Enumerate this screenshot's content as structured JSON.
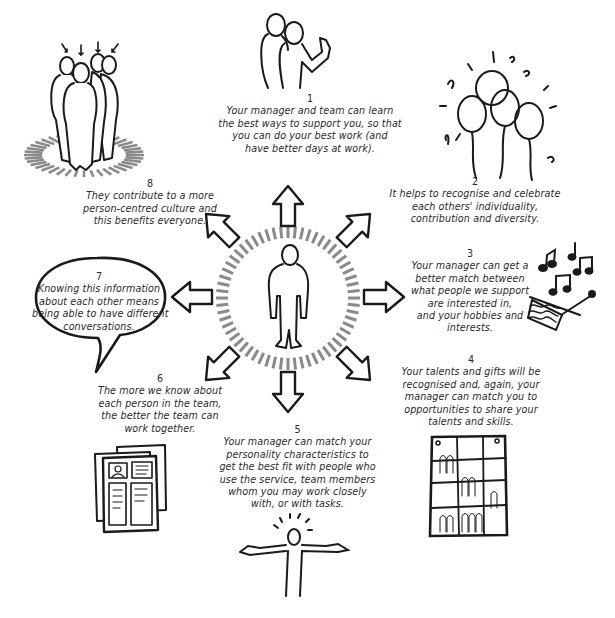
{
  "diagram": {
    "center": {
      "label": "person-centre",
      "icon": "standing-person-icon"
    },
    "items": [
      {
        "number": "1",
        "lines": [
          "Your manager and team can learn",
          "the best ways to support you, so that",
          "you can do your best work (and",
          "have better days at work)."
        ],
        "icon": "thumbs-up-colleagues-icon"
      },
      {
        "number": "2",
        "lines": [
          "It helps to recognise and celebrate",
          "each others' individuality,",
          "contribution and diversity."
        ],
        "icon": "balloons-icon"
      },
      {
        "number": "3",
        "lines": [
          "Your manager can get a",
          "better match between",
          "what people we support",
          "are interested in,",
          "and your hobbies and",
          "interests."
        ],
        "icon": "music-knitting-icon"
      },
      {
        "number": "4",
        "lines": [
          "Your talents and gifts will be",
          "recognised and, again, your",
          "manager can match you to",
          "opportunities to share your",
          "talents and skills."
        ],
        "icon": "rota-board-icon"
      },
      {
        "number": "5",
        "lines": [
          "Your manager can match your",
          "personality characteristics to",
          "get the best fit with people who",
          "use the service, team members",
          "whom you may work closely",
          "with, or with tasks."
        ],
        "icon": "open-arms-person-icon"
      },
      {
        "number": "6",
        "lines": [
          "The more we know about",
          "each person in the team,",
          "the better the team can",
          "work together."
        ],
        "icon": "profile-documents-icon"
      },
      {
        "number": "7",
        "lines": [
          "Knowing this information",
          "about each other means",
          "being able to have different",
          "conversations."
        ],
        "icon": "speech-bubble-icon"
      },
      {
        "number": "8",
        "lines": [
          "They contribute to a more",
          "person-centred culture and",
          "this benefits everyone."
        ],
        "icon": "group-spotlight-icon"
      }
    ]
  },
  "colors": {
    "ink": "#1a1a1a",
    "dash": "#8a8a8a",
    "background": "#ffffff"
  }
}
